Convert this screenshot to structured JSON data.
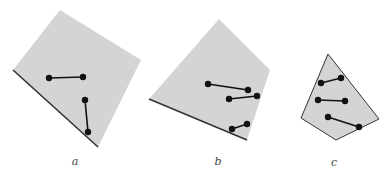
{
  "figure": {
    "colors": {
      "fill": "#d4d4d4",
      "edge": "#333333",
      "point": "#111111"
    },
    "panels": [
      {
        "label": "a",
        "label_pos": [
          75,
          165
        ],
        "polygon": [
          [
            60,
            10
          ],
          [
            141,
            60
          ],
          [
            98,
            147
          ],
          [
            13,
            70
          ]
        ],
        "dark_edge": [
          [
            13,
            70
          ],
          [
            98,
            147
          ]
        ],
        "segments": [
          [
            [
              49,
              78
            ],
            [
              83,
              77
            ]
          ],
          [
            [
              85,
              100
            ],
            [
              88,
              132
            ]
          ]
        ]
      },
      {
        "label": "b",
        "label_pos": [
          218,
          165
        ],
        "polygon": [
          [
            219,
            19
          ],
          [
            270,
            70
          ],
          [
            247,
            140
          ],
          [
            149,
            99
          ]
        ],
        "dark_edge": [
          [
            149,
            99
          ],
          [
            247,
            140
          ]
        ],
        "segments": [
          [
            [
              208,
              84
            ],
            [
              248,
              90
            ]
          ],
          [
            [
              229,
              99
            ],
            [
              257,
              96
            ]
          ],
          [
            [
              232,
              129
            ],
            [
              247,
              124
            ]
          ]
        ]
      },
      {
        "label": "c",
        "label_pos": [
          334,
          166
        ],
        "polygon": [
          [
            328,
            54
          ],
          [
            379,
            119
          ],
          [
            336,
            140
          ],
          [
            301,
            118
          ]
        ],
        "dark_edge": null,
        "segments": [
          [
            [
              321,
              83
            ],
            [
              341,
              78
            ]
          ],
          [
            [
              318,
              100
            ],
            [
              345,
              101
            ]
          ],
          [
            [
              328,
              117
            ],
            [
              359,
              127
            ]
          ]
        ]
      }
    ]
  }
}
